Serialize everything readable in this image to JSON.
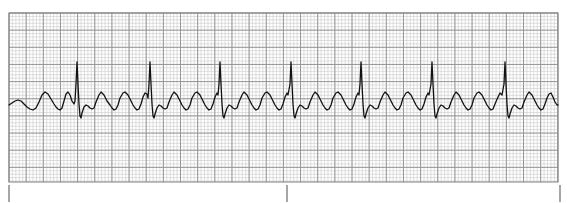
{
  "document": {
    "title": "ECG Rhythm Strip",
    "caption": ""
  },
  "colors": {
    "background": "#ffffff",
    "grid_fine": "#c9c9c9",
    "grid_bold": "#8f8f8f",
    "grid_border": "#808080",
    "trace": "#111111",
    "tick_mark": "#6b6b6b"
  },
  "grid": {
    "label": "ECG graph paper",
    "x": 9,
    "y": 13,
    "width": 549,
    "height": 169,
    "small_box_px": 3.43,
    "large_box_px": 17.15,
    "small_boxes_per_large": 5,
    "paper_speed": "25 mm/s",
    "gain": "10 mm/mV",
    "show_fine_lines": true,
    "show_bold_lines": true
  },
  "time_ticks": {
    "label": "three-second interval markers",
    "y_top": 185,
    "y_bottom": 202,
    "positions_px": [
      9,
      287,
      560
    ],
    "labels": [
      "",
      "",
      ""
    ]
  },
  "chart_data": {
    "type": "line",
    "title": "ECG Rhythm Strip",
    "subtitle": "",
    "xlabel": "Time",
    "ylabel": "Amplitude",
    "xlim": [
      9,
      558
    ],
    "ylim": [
      182,
      13
    ],
    "grid": true,
    "legend_position": "none",
    "annotations": [],
    "baseline_y_px": 105,
    "trace_stroke_width": 1.3,
    "rhythm": {
      "interpretation": "Atrial flutter with variable conduction",
      "qrs_count": 7,
      "flutter_waves_between_qrs": 3,
      "qrs_peak_x_px": [
        77,
        150,
        220,
        291,
        361,
        432,
        505
      ],
      "qrs_r_peak_y_px": 62,
      "qrs_s_trough_y_px": 118,
      "flutter_peak_y_px": 92,
      "flutter_trough_y_px": 110,
      "flutter_period_px": 17.6
    },
    "series": [
      {
        "name": "Lead II",
        "points": [
          [
            9,
            105
          ],
          [
            12,
            103
          ],
          [
            15,
            101
          ],
          [
            18,
            100
          ],
          [
            21,
            101
          ],
          [
            24,
            104
          ],
          [
            27,
            107
          ],
          [
            30,
            109
          ],
          [
            33,
            110
          ],
          [
            36,
            108
          ],
          [
            39,
            102
          ],
          [
            42,
            95
          ],
          [
            45,
            92
          ],
          [
            48,
            94
          ],
          [
            51,
            99
          ],
          [
            54,
            104
          ],
          [
            56,
            107
          ],
          [
            58,
            109
          ],
          [
            60,
            110
          ],
          [
            62,
            108
          ],
          [
            64,
            101
          ],
          [
            66,
            94
          ],
          [
            68,
            92
          ],
          [
            70,
            95
          ],
          [
            72,
            101
          ],
          [
            74,
            104
          ],
          [
            75,
            101
          ],
          [
            76,
            84
          ],
          [
            77,
            62
          ],
          [
            78,
            84
          ],
          [
            79,
            104
          ],
          [
            80,
            116
          ],
          [
            81,
            118
          ],
          [
            82,
            113
          ],
          [
            84,
            107
          ],
          [
            86,
            105
          ],
          [
            88,
            106
          ],
          [
            90,
            108
          ],
          [
            92,
            109
          ],
          [
            94,
            108
          ],
          [
            96,
            102
          ],
          [
            99,
            95
          ],
          [
            101,
            92
          ],
          [
            104,
            95
          ],
          [
            107,
            101
          ],
          [
            110,
            105
          ],
          [
            112,
            108
          ],
          [
            114,
            110
          ],
          [
            116,
            109
          ],
          [
            118,
            105
          ],
          [
            120,
            98
          ],
          [
            123,
            93
          ],
          [
            125,
            92
          ],
          [
            128,
            95
          ],
          [
            131,
            101
          ],
          [
            133,
            105
          ],
          [
            135,
            108
          ],
          [
            137,
            110
          ],
          [
            139,
            109
          ],
          [
            141,
            104
          ],
          [
            143,
            97
          ],
          [
            145,
            93
          ],
          [
            147,
            94
          ],
          [
            148,
            98
          ],
          [
            149,
            84
          ],
          [
            150,
            62
          ],
          [
            151,
            84
          ],
          [
            152,
            104
          ],
          [
            153,
            116
          ],
          [
            154,
            118
          ],
          [
            155,
            114
          ],
          [
            157,
            108
          ],
          [
            159,
            105
          ],
          [
            161,
            106
          ],
          [
            163,
            108
          ],
          [
            165,
            109
          ],
          [
            167,
            108
          ],
          [
            169,
            102
          ],
          [
            172,
            95
          ],
          [
            174,
            92
          ],
          [
            177,
            95
          ],
          [
            180,
            101
          ],
          [
            182,
            105
          ],
          [
            184,
            108
          ],
          [
            186,
            110
          ],
          [
            188,
            109
          ],
          [
            190,
            105
          ],
          [
            192,
            98
          ],
          [
            195,
            93
          ],
          [
            197,
            92
          ],
          [
            200,
            95
          ],
          [
            203,
            101
          ],
          [
            205,
            105
          ],
          [
            207,
            108
          ],
          [
            209,
            110
          ],
          [
            211,
            109
          ],
          [
            213,
            104
          ],
          [
            215,
            97
          ],
          [
            217,
            93
          ],
          [
            218,
            95
          ],
          [
            219,
            84
          ],
          [
            220,
            62
          ],
          [
            221,
            84
          ],
          [
            222,
            104
          ],
          [
            223,
            116
          ],
          [
            224,
            118
          ],
          [
            225,
            114
          ],
          [
            227,
            108
          ],
          [
            229,
            105
          ],
          [
            231,
            106
          ],
          [
            233,
            108
          ],
          [
            235,
            109
          ],
          [
            237,
            108
          ],
          [
            239,
            102
          ],
          [
            242,
            95
          ],
          [
            244,
            92
          ],
          [
            247,
            95
          ],
          [
            250,
            101
          ],
          [
            252,
            105
          ],
          [
            254,
            108
          ],
          [
            256,
            110
          ],
          [
            258,
            109
          ],
          [
            260,
            105
          ],
          [
            262,
            98
          ],
          [
            265,
            93
          ],
          [
            267,
            92
          ],
          [
            270,
            95
          ],
          [
            273,
            101
          ],
          [
            275,
            105
          ],
          [
            277,
            108
          ],
          [
            279,
            110
          ],
          [
            281,
            109
          ],
          [
            283,
            104
          ],
          [
            285,
            97
          ],
          [
            287,
            93
          ],
          [
            288,
            95
          ],
          [
            290,
            84
          ],
          [
            291,
            62
          ],
          [
            292,
            84
          ],
          [
            293,
            104
          ],
          [
            294,
            116
          ],
          [
            295,
            118
          ],
          [
            296,
            114
          ],
          [
            298,
            108
          ],
          [
            300,
            105
          ],
          [
            302,
            106
          ],
          [
            304,
            108
          ],
          [
            306,
            109
          ],
          [
            308,
            108
          ],
          [
            310,
            102
          ],
          [
            313,
            95
          ],
          [
            315,
            92
          ],
          [
            318,
            95
          ],
          [
            321,
            101
          ],
          [
            323,
            105
          ],
          [
            325,
            108
          ],
          [
            327,
            110
          ],
          [
            329,
            109
          ],
          [
            331,
            105
          ],
          [
            333,
            98
          ],
          [
            336,
            93
          ],
          [
            338,
            92
          ],
          [
            341,
            95
          ],
          [
            344,
            101
          ],
          [
            346,
            105
          ],
          [
            348,
            108
          ],
          [
            350,
            110
          ],
          [
            352,
            109
          ],
          [
            354,
            104
          ],
          [
            356,
            97
          ],
          [
            358,
            93
          ],
          [
            359,
            95
          ],
          [
            360,
            84
          ],
          [
            361,
            62
          ],
          [
            362,
            84
          ],
          [
            363,
            104
          ],
          [
            364,
            116
          ],
          [
            365,
            118
          ],
          [
            366,
            114
          ],
          [
            368,
            108
          ],
          [
            370,
            105
          ],
          [
            372,
            106
          ],
          [
            374,
            108
          ],
          [
            376,
            109
          ],
          [
            378,
            108
          ],
          [
            380,
            102
          ],
          [
            383,
            95
          ],
          [
            385,
            92
          ],
          [
            388,
            95
          ],
          [
            391,
            101
          ],
          [
            393,
            105
          ],
          [
            395,
            108
          ],
          [
            397,
            110
          ],
          [
            399,
            109
          ],
          [
            401,
            105
          ],
          [
            403,
            98
          ],
          [
            406,
            93
          ],
          [
            408,
            92
          ],
          [
            411,
            95
          ],
          [
            414,
            101
          ],
          [
            416,
            105
          ],
          [
            418,
            108
          ],
          [
            420,
            110
          ],
          [
            422,
            109
          ],
          [
            424,
            104
          ],
          [
            426,
            97
          ],
          [
            428,
            93
          ],
          [
            429,
            95
          ],
          [
            431,
            84
          ],
          [
            432,
            62
          ],
          [
            433,
            84
          ],
          [
            434,
            104
          ],
          [
            435,
            116
          ],
          [
            436,
            118
          ],
          [
            437,
            114
          ],
          [
            439,
            108
          ],
          [
            441,
            105
          ],
          [
            443,
            106
          ],
          [
            445,
            108
          ],
          [
            447,
            109
          ],
          [
            449,
            108
          ],
          [
            451,
            102
          ],
          [
            454,
            95
          ],
          [
            456,
            92
          ],
          [
            459,
            95
          ],
          [
            462,
            101
          ],
          [
            464,
            105
          ],
          [
            466,
            108
          ],
          [
            468,
            110
          ],
          [
            470,
            109
          ],
          [
            472,
            105
          ],
          [
            474,
            98
          ],
          [
            477,
            93
          ],
          [
            479,
            92
          ],
          [
            482,
            95
          ],
          [
            485,
            101
          ],
          [
            487,
            105
          ],
          [
            489,
            108
          ],
          [
            491,
            110
          ],
          [
            493,
            109
          ],
          [
            495,
            104
          ],
          [
            498,
            97
          ],
          [
            500,
            93
          ],
          [
            502,
            95
          ],
          [
            504,
            84
          ],
          [
            505,
            62
          ],
          [
            506,
            84
          ],
          [
            507,
            104
          ],
          [
            508,
            116
          ],
          [
            509,
            118
          ],
          [
            510,
            114
          ],
          [
            512,
            108
          ],
          [
            514,
            105
          ],
          [
            516,
            106
          ],
          [
            518,
            108
          ],
          [
            520,
            109
          ],
          [
            522,
            108
          ],
          [
            524,
            102
          ],
          [
            527,
            95
          ],
          [
            529,
            92
          ],
          [
            532,
            95
          ],
          [
            535,
            101
          ],
          [
            537,
            105
          ],
          [
            539,
            108
          ],
          [
            541,
            110
          ],
          [
            543,
            109
          ],
          [
            545,
            104
          ],
          [
            547,
            98
          ],
          [
            549,
            94
          ],
          [
            551,
            93
          ],
          [
            553,
            97
          ],
          [
            555,
            102
          ],
          [
            557,
            105
          ],
          [
            558,
            105
          ]
        ]
      }
    ]
  }
}
